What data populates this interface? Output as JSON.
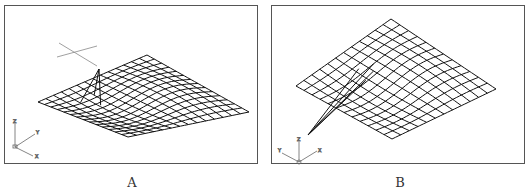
{
  "panels": [
    {
      "id": "A",
      "caption": "A",
      "axis_labels": {
        "z": "Z",
        "y": "Y",
        "x": "X"
      },
      "description": "Wireframe mesh surface with a single pulled control vertex (peak) near upper-left; grey crosshair cursor above"
    },
    {
      "id": "B",
      "caption": "B",
      "axis_labels": {
        "z": "Z",
        "y": "Y",
        "x": "X"
      },
      "description": "Wireframe mesh surface viewed from a rotated angle; control vertex pulled down toward lower-left forming spike lines"
    }
  ],
  "colors": {
    "mesh": "#111111",
    "frame": "#555555",
    "cursor": "#888888",
    "axis": "#666666"
  }
}
